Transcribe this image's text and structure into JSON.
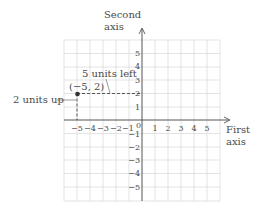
{
  "diagram": {
    "type": "coordinate-plane",
    "axes": {
      "x_label_line1": "First",
      "x_label_line2": "axis",
      "y_label_line1": "Second",
      "y_label_line2": "axis",
      "origin_label": "0"
    },
    "x_ticks": [
      "−5",
      "−4",
      "−3",
      "−2",
      "−1",
      "1",
      "2",
      "3",
      "4",
      "5"
    ],
    "y_ticks": [
      "5",
      "4",
      "3",
      "2",
      "1",
      "−1",
      "−2",
      "−3",
      "−4",
      "−5"
    ],
    "point": {
      "label": "(−5, 2)",
      "x": -5,
      "y": 2
    },
    "annotations": {
      "horizontal": "5 units left",
      "vertical": "2 units up"
    },
    "colors": {
      "grid": "#d9d9d9",
      "axis": "#555555",
      "text": "#4a4a4a",
      "point": "#333333",
      "dashed": "#444444"
    }
  }
}
